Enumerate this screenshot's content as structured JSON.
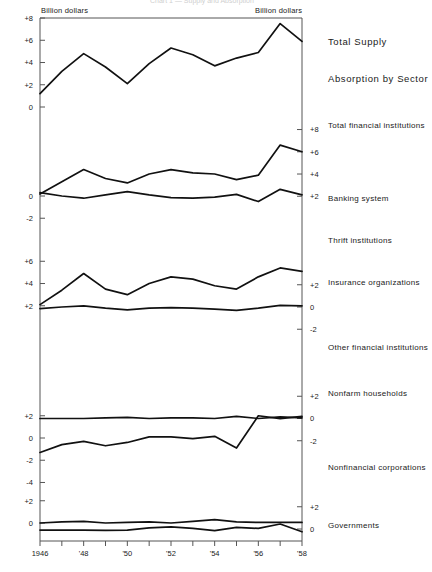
{
  "header": {
    "faint_title": "Chart 1 —  Supply and Absorption",
    "left_unit": "Billion dollars",
    "right_unit": "Billion dollars"
  },
  "chart_data": {
    "type": "line",
    "xlabel": "",
    "ylabel": "Billion dollars",
    "grid": false,
    "legend": "right-of-panel labels",
    "x": [
      1946,
      1947,
      1948,
      1949,
      1950,
      1951,
      1952,
      1953,
      1954,
      1955,
      1956,
      1957,
      1958
    ],
    "xtick_labels": [
      "1946",
      "",
      "'48",
      "",
      "'50",
      "",
      "'52",
      "",
      "'54",
      "",
      "'56",
      "",
      "'58"
    ],
    "group_headings": [
      "Total Supply",
      "Absorption by Sector"
    ],
    "panels": [
      {
        "name": "Total Supply",
        "label": "Total  Supply",
        "heading": true,
        "axis_side": "left",
        "yticks": [
          8,
          6,
          4,
          2,
          0
        ],
        "ytick_labels": [
          "+8",
          "+6",
          "+4",
          "+2",
          "0"
        ],
        "ylim": [
          0,
          8
        ],
        "values": [
          1.2,
          3.2,
          4.8,
          3.6,
          2.1,
          3.9,
          5.3,
          4.7,
          3.7,
          4.4,
          4.9,
          7.5,
          5.9
        ]
      },
      {
        "name": "Total financial institutions",
        "label": "Total financial institutions",
        "heading": false,
        "axis_side": "right",
        "yticks": [
          8,
          6,
          4,
          2
        ],
        "ytick_labels": [
          "+8",
          "+6",
          "+4",
          "+2"
        ],
        "ylim": [
          2,
          8
        ],
        "values": [
          2.2,
          3.3,
          4.4,
          3.6,
          3.2,
          4.0,
          4.4,
          4.1,
          4.0,
          3.5,
          3.9,
          6.6,
          6.0
        ]
      },
      {
        "name": "Banking system",
        "label": "Banking  system",
        "heading": false,
        "axis_side": "left",
        "yticks": [
          0,
          -2
        ],
        "ytick_labels": [
          "0",
          "-2"
        ],
        "ylim": [
          -2.6,
          0.9
        ],
        "values": [
          0.3,
          0.0,
          -0.2,
          0.1,
          0.4,
          0.1,
          -0.15,
          -0.2,
          -0.1,
          0.15,
          -0.5,
          0.6,
          0.1
        ]
      },
      {
        "name": "Thrift institutions",
        "label": "Thrift  institutions",
        "heading": false,
        "axis_side": "right",
        "yticks": [
          2,
          0,
          -2
        ],
        "ytick_labels": [
          "+2",
          "0",
          "-2"
        ],
        "ylim": [
          -2.4,
          2.0
        ],
        "values": [
          -0.15,
          0.0,
          0.1,
          -0.1,
          -0.25,
          -0.1,
          -0.05,
          -0.1,
          -0.2,
          -0.3,
          -0.1,
          0.15,
          0.1
        ]
      },
      {
        "name": "Insurance organizations",
        "label": "Insurance  organizations",
        "heading": false,
        "axis_side": "left",
        "yticks": [
          6,
          4,
          2
        ],
        "ytick_labels": [
          "+6",
          "+4",
          "+2"
        ],
        "ylim": [
          2,
          7
        ],
        "values": [
          2.1,
          3.4,
          4.9,
          3.5,
          3.0,
          4.0,
          4.6,
          4.4,
          3.8,
          3.5,
          4.6,
          5.4,
          5.1
        ]
      },
      {
        "name": "Other financial institutions",
        "label": "Other  financial  institutions",
        "heading": false,
        "axis_side": "right",
        "yticks": [
          2,
          0,
          -2
        ],
        "ytick_labels": [
          "+2",
          "0",
          "-2"
        ],
        "ylim": [
          -2.4,
          2.0
        ],
        "values": [
          0.0,
          0.0,
          0.0,
          0.05,
          0.1,
          0.0,
          0.05,
          0.05,
          0.0,
          0.2,
          0.0,
          0.15,
          0.05
        ]
      },
      {
        "name": "Nonfarm households",
        "label": "Nonfarm  households",
        "heading": false,
        "axis_side": "left",
        "yticks": [
          2,
          0,
          -2,
          -4
        ],
        "ytick_labels": [
          "+2",
          "0",
          "-2",
          "-4"
        ],
        "ylim": [
          -5.2,
          2.4
        ],
        "values": [
          -1.3,
          -0.6,
          -0.3,
          -0.7,
          -0.4,
          0.1,
          0.1,
          -0.05,
          0.15,
          -0.9,
          2.0,
          1.75,
          1.95
        ]
      },
      {
        "name": "Nonfinancial corporations",
        "label": "Nonfinancial  corporations",
        "heading": false,
        "axis_side": "right",
        "yticks": [
          2,
          0,
          -2
        ],
        "ytick_labels": [
          "+2",
          "0",
          "-2"
        ],
        "ylim": [
          -2.4,
          2.2
        ],
        "values": [
          -0.1,
          -0.1,
          -0.1,
          -0.12,
          -0.1,
          0.1,
          0.2,
          0.05,
          -0.15,
          0.15,
          0.05,
          0.45,
          -0.25
        ]
      },
      {
        "name": "Governments",
        "label": "Governments",
        "heading": false,
        "axis_side": "left",
        "yticks": [
          2,
          0,
          -2
        ],
        "ytick_labels": [
          "+2",
          "0",
          "-2"
        ],
        "ylim": [
          -2,
          2.4
        ],
        "values": [
          0.0,
          0.1,
          0.15,
          0.0,
          0.05,
          0.1,
          0.0,
          0.15,
          0.3,
          0.1,
          0.05,
          0.05,
          0.05
        ]
      }
    ]
  }
}
